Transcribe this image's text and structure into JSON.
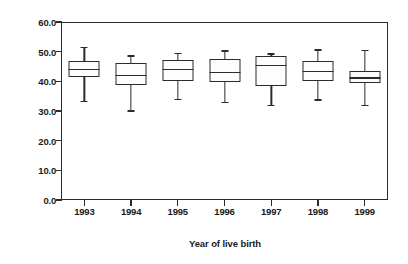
{
  "chart_data": {
    "type": "box",
    "title": "",
    "xlabel": "Year of live birth",
    "ylabel": "Percentage of live births unintended",
    "categories": [
      "1993",
      "1994",
      "1995",
      "1996",
      "1997",
      "1998",
      "1999"
    ],
    "ylim": [
      0.0,
      60.0
    ],
    "ytick_labels": [
      "0.0",
      "10.0",
      "20.0",
      "30.0",
      "40.0",
      "50.0",
      "60.0"
    ],
    "ytick_values": [
      0.0,
      10.0,
      20.0,
      30.0,
      40.0,
      50.0,
      60.0
    ],
    "grid": false,
    "legend": "none",
    "boxes": [
      {
        "category": "1993",
        "whisker_low": 33.5,
        "q1": 41.3,
        "median": 44.3,
        "q3": 47.0,
        "whisker_high": 51.6
      },
      {
        "category": "1994",
        "whisker_low": 30.2,
        "q1": 38.6,
        "median": 42.3,
        "q3": 46.1,
        "whisker_high": 48.8
      },
      {
        "category": "1995",
        "whisker_low": 34.2,
        "q1": 40.1,
        "median": 44.2,
        "q3": 47.1,
        "whisker_high": 49.6
      },
      {
        "category": "1996",
        "whisker_low": 33.1,
        "q1": 39.8,
        "median": 43.1,
        "q3": 47.6,
        "whisker_high": 50.4
      },
      {
        "category": "1997",
        "whisker_low": 32.0,
        "q1": 38.5,
        "median": 45.5,
        "q3": 48.5,
        "whisker_high": 49.4
      },
      {
        "category": "1998",
        "whisker_low": 33.9,
        "q1": 40.0,
        "median": 43.5,
        "q3": 47.0,
        "whisker_high": 50.8
      },
      {
        "category": "1999",
        "whisker_low": 32.0,
        "q1": 39.6,
        "median": 41.3,
        "q3": 43.4,
        "whisker_high": 50.5
      }
    ]
  },
  "axes": {
    "y_title": "Percentage of live births unintended",
    "x_title": "Year of live birth"
  },
  "colors": {
    "axis": "#2b2b2b",
    "box_fill": "#fdfdfd",
    "background": "#ffffff"
  }
}
